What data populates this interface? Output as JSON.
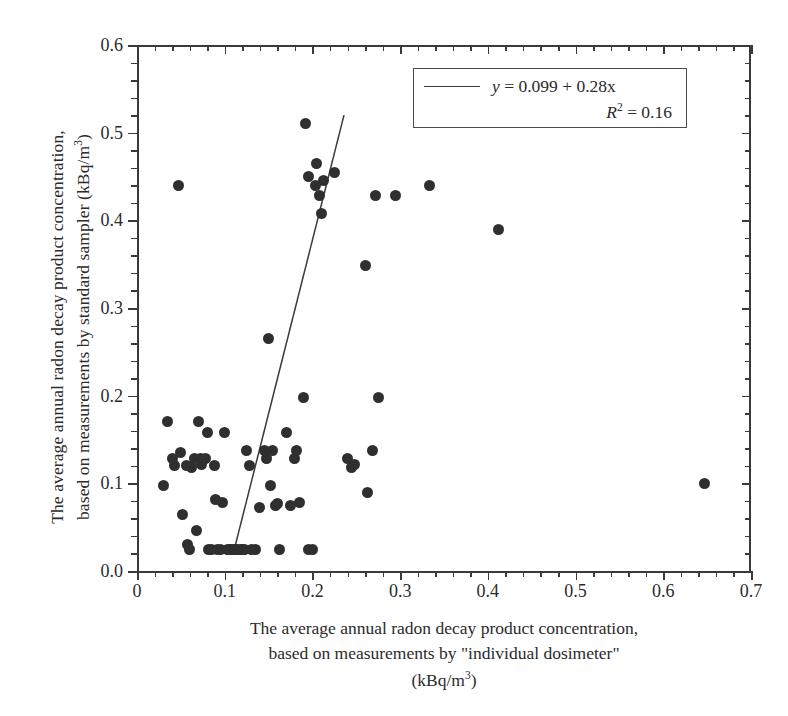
{
  "chart_data": {
    "type": "scatter",
    "title": "",
    "xlabel": "The average annual radon decay product concentration, based on measurements by \"individual dosimeter\" (kBq/m3)",
    "ylabel": "The average annual radon decay product concentration, based on measurements by standard sampler (kBq/m3)",
    "xlim": [
      0,
      0.7
    ],
    "ylim": [
      0.0,
      0.6
    ],
    "xticks": [
      0,
      0.1,
      0.2,
      0.3,
      0.4,
      0.5,
      0.6,
      0.7
    ],
    "xtick_labels": [
      "0",
      "0.1",
      "0.2",
      "0.3",
      "0.4",
      "0.5",
      "0.6",
      "0.7"
    ],
    "yticks": [
      0.0,
      0.1,
      0.2,
      0.3,
      0.4,
      0.5,
      0.6
    ],
    "ytick_labels": [
      "0.0",
      "0.1",
      "0.2",
      "0.3",
      "0.4",
      "0.5",
      "0.6"
    ],
    "x_minor_tick_step": 0.02,
    "y_minor_tick_step": 0.02,
    "grid": false,
    "legend_position": "top-center-right",
    "marker_color": "#2f2f2f",
    "line_color": "#3a3a3a",
    "axis_color": "#3a3a3a",
    "marker_size_px": 11,
    "points": [
      [
        0.03,
        0.098
      ],
      [
        0.035,
        0.17
      ],
      [
        0.04,
        0.128
      ],
      [
        0.043,
        0.12
      ],
      [
        0.047,
        0.44
      ],
      [
        0.05,
        0.135
      ],
      [
        0.052,
        0.065
      ],
      [
        0.056,
        0.12
      ],
      [
        0.058,
        0.03
      ],
      [
        0.06,
        0.025
      ],
      [
        0.062,
        0.118
      ],
      [
        0.066,
        0.128
      ],
      [
        0.068,
        0.046
      ],
      [
        0.07,
        0.17
      ],
      [
        0.072,
        0.128
      ],
      [
        0.074,
        0.122
      ],
      [
        0.078,
        0.128
      ],
      [
        0.08,
        0.158
      ],
      [
        0.082,
        0.025
      ],
      [
        0.085,
        0.025
      ],
      [
        0.088,
        0.12
      ],
      [
        0.09,
        0.082
      ],
      [
        0.092,
        0.025
      ],
      [
        0.095,
        0.025
      ],
      [
        0.098,
        0.078
      ],
      [
        0.1,
        0.158
      ],
      [
        0.103,
        0.025
      ],
      [
        0.105,
        0.025
      ],
      [
        0.108,
        0.025
      ],
      [
        0.11,
        0.025
      ],
      [
        0.112,
        0.025
      ],
      [
        0.115,
        0.025
      ],
      [
        0.118,
        0.025
      ],
      [
        0.12,
        0.025
      ],
      [
        0.122,
        0.025
      ],
      [
        0.125,
        0.138
      ],
      [
        0.128,
        0.12
      ],
      [
        0.13,
        0.025
      ],
      [
        0.135,
        0.025
      ],
      [
        0.14,
        0.072
      ],
      [
        0.145,
        0.138
      ],
      [
        0.148,
        0.128
      ],
      [
        0.15,
        0.265
      ],
      [
        0.152,
        0.098
      ],
      [
        0.155,
        0.138
      ],
      [
        0.158,
        0.075
      ],
      [
        0.16,
        0.077
      ],
      [
        0.163,
        0.025
      ],
      [
        0.17,
        0.158
      ],
      [
        0.175,
        0.075
      ],
      [
        0.18,
        0.128
      ],
      [
        0.182,
        0.138
      ],
      [
        0.185,
        0.078
      ],
      [
        0.19,
        0.198
      ],
      [
        0.192,
        0.51
      ],
      [
        0.195,
        0.45
      ],
      [
        0.196,
        0.025
      ],
      [
        0.2,
        0.025
      ],
      [
        0.203,
        0.44
      ],
      [
        0.205,
        0.465
      ],
      [
        0.208,
        0.428
      ],
      [
        0.21,
        0.408
      ],
      [
        0.213,
        0.445
      ],
      [
        0.225,
        0.455
      ],
      [
        0.24,
        0.128
      ],
      [
        0.245,
        0.118
      ],
      [
        0.248,
        0.122
      ],
      [
        0.26,
        0.348
      ],
      [
        0.263,
        0.09
      ],
      [
        0.268,
        0.138
      ],
      [
        0.272,
        0.428
      ],
      [
        0.275,
        0.198
      ],
      [
        0.295,
        0.428
      ],
      [
        0.334,
        0.44
      ],
      [
        0.412,
        0.39
      ],
      [
        0.647,
        0.1
      ]
    ],
    "fit": {
      "equation": "y = 0.099 + 0.28x",
      "intercept": 0.099,
      "slope": 0.28,
      "r_squared": 0.16,
      "drawn_from": [
        0.111,
        0.025
      ],
      "drawn_to": [
        0.236,
        0.52
      ]
    },
    "legend": {
      "equation_prefix": "y",
      "equation_body": " = 0.099 + 0.28x",
      "equation_full": "y = 0.099 + 0.28x",
      "r2_label": "R",
      "r2_exponent": "2",
      "r2_value": " = 0.16",
      "r2_full": "R2 = 0.16"
    }
  },
  "axes": {
    "y_title_line1": "The average annual radon decay product concentration,",
    "y_title_line2_a": "based on measurements by standard sampler  (kBq/m",
    "y_title_line2_sup": "3",
    "y_title_line2_b": ")",
    "x_title_line1": "The average annual radon decay product concentration,",
    "x_title_line2": "based on measurements by \"individual dosimeter\"",
    "x_title_line3_a": "(kBq/m",
    "x_title_line3_sup": "3",
    "x_title_line3_b": ")"
  }
}
